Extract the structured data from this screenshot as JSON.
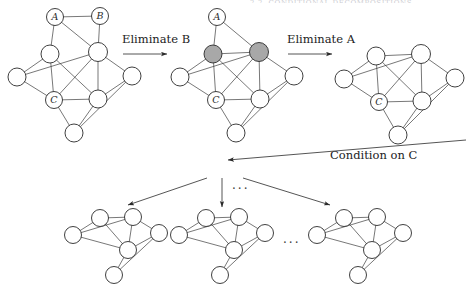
{
  "figure": {
    "title_strip": "2.2.  CONDITIONAL DECOMPOSITIONS",
    "kind": "graph-elimination-diagram",
    "ink_color": "#2a2a2a",
    "node_fill": "#ffffff",
    "eliminated_fill": "#a8a8a8",
    "labels": {
      "eliminate_b": "Eliminate B",
      "eliminate_a": "Eliminate A",
      "condition_on_c": "Condition on C",
      "vertical_ellipsis": "...",
      "horizontal_ellipsis": "..."
    },
    "node_labels": {
      "a": "A",
      "b": "B",
      "c": "C"
    }
  },
  "graphs": [
    {
      "id": "graph-original",
      "name": "original-graph",
      "caption": "",
      "nodes": [
        {
          "id": "A",
          "x": 55,
          "y": 17,
          "r": 8.5,
          "label": "A",
          "fill": "white"
        },
        {
          "id": "B",
          "x": 100,
          "y": 16,
          "r": 8.5,
          "label": "B",
          "fill": "white"
        },
        {
          "id": "n1",
          "x": 50,
          "y": 54,
          "r": 9,
          "label": "",
          "fill": "white"
        },
        {
          "id": "n2",
          "x": 98,
          "y": 52,
          "r": 9.5,
          "label": "",
          "fill": "white"
        },
        {
          "id": "n3",
          "x": 17,
          "y": 77,
          "r": 9,
          "label": "",
          "fill": "white"
        },
        {
          "id": "n4",
          "x": 132,
          "y": 76,
          "r": 9,
          "label": "",
          "fill": "white"
        },
        {
          "id": "C",
          "x": 54,
          "y": 100,
          "r": 8.5,
          "label": "C",
          "fill": "white"
        },
        {
          "id": "n5",
          "x": 98,
          "y": 99,
          "r": 9,
          "label": "",
          "fill": "white"
        },
        {
          "id": "n6",
          "x": 74,
          "y": 133,
          "r": 9,
          "label": "",
          "fill": "white"
        }
      ],
      "edges": [
        [
          "A",
          "B"
        ],
        [
          "A",
          "n1"
        ],
        [
          "A",
          "n2"
        ],
        [
          "B",
          "n2"
        ],
        [
          "n1",
          "n3"
        ],
        [
          "n1",
          "C"
        ],
        [
          "n1",
          "n5"
        ],
        [
          "n2",
          "n3"
        ],
        [
          "n2",
          "n4"
        ],
        [
          "n2",
          "C"
        ],
        [
          "n2",
          "n5"
        ],
        [
          "n3",
          "C"
        ],
        [
          "n4",
          "n5"
        ],
        [
          "n4",
          "n6"
        ],
        [
          "C",
          "n5"
        ],
        [
          "C",
          "n6"
        ],
        [
          "n5",
          "n6"
        ]
      ]
    },
    {
      "id": "graph-eliminated-b",
      "name": "graph-after-eliminating-b",
      "caption": "",
      "nodes": [
        {
          "id": "A",
          "x": 217,
          "y": 17,
          "r": 8.5,
          "label": "A",
          "fill": "white"
        },
        {
          "id": "n1",
          "x": 213,
          "y": 54,
          "r": 9,
          "label": "",
          "fill": "grey"
        },
        {
          "id": "n2",
          "x": 259,
          "y": 52,
          "r": 9.5,
          "label": "",
          "fill": "grey"
        },
        {
          "id": "n3",
          "x": 180,
          "y": 77,
          "r": 9,
          "label": "",
          "fill": "white"
        },
        {
          "id": "n4",
          "x": 294,
          "y": 76,
          "r": 9,
          "label": "",
          "fill": "white"
        },
        {
          "id": "C",
          "x": 216,
          "y": 100,
          "r": 8.5,
          "label": "C",
          "fill": "white"
        },
        {
          "id": "n5",
          "x": 260,
          "y": 99,
          "r": 9,
          "label": "",
          "fill": "white"
        },
        {
          "id": "n6",
          "x": 236,
          "y": 133,
          "r": 9,
          "label": "",
          "fill": "white"
        }
      ],
      "edges": [
        [
          "A",
          "n1"
        ],
        [
          "A",
          "n2"
        ],
        [
          "n1",
          "n2"
        ],
        [
          "n1",
          "n3"
        ],
        [
          "n1",
          "C"
        ],
        [
          "n1",
          "n5"
        ],
        [
          "n2",
          "n3"
        ],
        [
          "n2",
          "n4"
        ],
        [
          "n2",
          "C"
        ],
        [
          "n2",
          "n5"
        ],
        [
          "n3",
          "C"
        ],
        [
          "n4",
          "n5"
        ],
        [
          "n4",
          "n6"
        ],
        [
          "C",
          "n5"
        ],
        [
          "C",
          "n6"
        ],
        [
          "n5",
          "n6"
        ]
      ]
    },
    {
      "id": "graph-eliminated-a",
      "name": "graph-after-eliminating-a",
      "caption": "",
      "nodes": [
        {
          "id": "n1",
          "x": 376,
          "y": 56,
          "r": 9,
          "label": "",
          "fill": "white"
        },
        {
          "id": "n2",
          "x": 421,
          "y": 54,
          "r": 9.5,
          "label": "",
          "fill": "white"
        },
        {
          "id": "n3",
          "x": 344,
          "y": 79,
          "r": 9,
          "label": "",
          "fill": "white"
        },
        {
          "id": "n4",
          "x": 455,
          "y": 78,
          "r": 9,
          "label": "",
          "fill": "white"
        },
        {
          "id": "C",
          "x": 379,
          "y": 102,
          "r": 8.5,
          "label": "C",
          "fill": "white"
        },
        {
          "id": "n5",
          "x": 422,
          "y": 101,
          "r": 9,
          "label": "",
          "fill": "white"
        },
        {
          "id": "n6",
          "x": 398,
          "y": 135,
          "r": 9,
          "label": "",
          "fill": "white"
        }
      ],
      "edges": [
        [
          "n1",
          "n2"
        ],
        [
          "n1",
          "n3"
        ],
        [
          "n1",
          "C"
        ],
        [
          "n1",
          "n5"
        ],
        [
          "n2",
          "n3"
        ],
        [
          "n2",
          "n4"
        ],
        [
          "n2",
          "C"
        ],
        [
          "n2",
          "n5"
        ],
        [
          "n3",
          "C"
        ],
        [
          "n4",
          "n5"
        ],
        [
          "n4",
          "n6"
        ],
        [
          "C",
          "n5"
        ],
        [
          "C",
          "n6"
        ],
        [
          "n5",
          "n6"
        ]
      ]
    },
    {
      "id": "graph-cond-1",
      "name": "conditioned-graph-1",
      "caption": "",
      "nodes": [
        {
          "id": "m1",
          "x": 100,
          "y": 218,
          "r": 8.5,
          "label": "",
          "fill": "white"
        },
        {
          "id": "m2",
          "x": 133,
          "y": 217,
          "r": 8.5,
          "label": "",
          "fill": "white"
        },
        {
          "id": "m0",
          "x": 73,
          "y": 235,
          "r": 8.5,
          "label": "",
          "fill": "white"
        },
        {
          "id": "m3",
          "x": 159,
          "y": 233,
          "r": 8.5,
          "label": "",
          "fill": "white"
        },
        {
          "id": "m4",
          "x": 128,
          "y": 250,
          "r": 8.5,
          "label": "",
          "fill": "white"
        },
        {
          "id": "m5",
          "x": 114,
          "y": 275,
          "r": 8.5,
          "label": "",
          "fill": "white"
        }
      ],
      "edges": [
        [
          "m1",
          "m2"
        ],
        [
          "m1",
          "m0"
        ],
        [
          "m1",
          "m4"
        ],
        [
          "m2",
          "m0"
        ],
        [
          "m2",
          "m3"
        ],
        [
          "m2",
          "m4"
        ],
        [
          "m0",
          "m4"
        ],
        [
          "m3",
          "m4"
        ],
        [
          "m3",
          "m5"
        ],
        [
          "m4",
          "m5"
        ]
      ]
    },
    {
      "id": "graph-cond-2",
      "name": "conditioned-graph-2",
      "caption": "",
      "nodes": [
        {
          "id": "m1",
          "x": 206,
          "y": 218,
          "r": 8.5,
          "label": "",
          "fill": "white"
        },
        {
          "id": "m2",
          "x": 239,
          "y": 217,
          "r": 8.5,
          "label": "",
          "fill": "white"
        },
        {
          "id": "m0",
          "x": 179,
          "y": 235,
          "r": 8.5,
          "label": "",
          "fill": "white"
        },
        {
          "id": "m3",
          "x": 265,
          "y": 233,
          "r": 8.5,
          "label": "",
          "fill": "white"
        },
        {
          "id": "m4",
          "x": 234,
          "y": 250,
          "r": 8.5,
          "label": "",
          "fill": "white"
        },
        {
          "id": "m5",
          "x": 220,
          "y": 275,
          "r": 8.5,
          "label": "",
          "fill": "white"
        }
      ],
      "edges": [
        [
          "m1",
          "m2"
        ],
        [
          "m1",
          "m0"
        ],
        [
          "m1",
          "m4"
        ],
        [
          "m2",
          "m0"
        ],
        [
          "m2",
          "m3"
        ],
        [
          "m2",
          "m4"
        ],
        [
          "m0",
          "m4"
        ],
        [
          "m3",
          "m4"
        ],
        [
          "m3",
          "m5"
        ],
        [
          "m4",
          "m5"
        ]
      ]
    },
    {
      "id": "graph-cond-3",
      "name": "conditioned-graph-3",
      "caption": "",
      "nodes": [
        {
          "id": "m1",
          "x": 344,
          "y": 218,
          "r": 8.5,
          "label": "",
          "fill": "white"
        },
        {
          "id": "m2",
          "x": 377,
          "y": 217,
          "r": 8.5,
          "label": "",
          "fill": "white"
        },
        {
          "id": "m0",
          "x": 317,
          "y": 235,
          "r": 8.5,
          "label": "",
          "fill": "white"
        },
        {
          "id": "m3",
          "x": 403,
          "y": 233,
          "r": 8.5,
          "label": "",
          "fill": "white"
        },
        {
          "id": "m4",
          "x": 372,
          "y": 250,
          "r": 8.5,
          "label": "",
          "fill": "white"
        },
        {
          "id": "m5",
          "x": 358,
          "y": 275,
          "r": 8.5,
          "label": "",
          "fill": "white"
        }
      ],
      "edges": [
        [
          "m1",
          "m2"
        ],
        [
          "m1",
          "m0"
        ],
        [
          "m1",
          "m4"
        ],
        [
          "m2",
          "m0"
        ],
        [
          "m2",
          "m3"
        ],
        [
          "m2",
          "m4"
        ],
        [
          "m0",
          "m4"
        ],
        [
          "m3",
          "m4"
        ],
        [
          "m3",
          "m5"
        ],
        [
          "m4",
          "m5"
        ]
      ]
    }
  ],
  "arrows": [
    {
      "id": "arrow-eliminate-b",
      "x1": 123,
      "y1": 54,
      "x2": 167,
      "y2": 54,
      "label": "Eliminate B"
    },
    {
      "id": "arrow-eliminate-a",
      "x1": 288,
      "y1": 54,
      "x2": 332,
      "y2": 54,
      "label": "Eliminate A"
    },
    {
      "id": "arrow-condition-on-c",
      "x1": 466,
      "y1": 140,
      "x2": 228,
      "y2": 160,
      "label": "Condition on C"
    },
    {
      "id": "arrow-branch-left",
      "x1": 207,
      "y1": 178,
      "x2": 128,
      "y2": 205,
      "label": ""
    },
    {
      "id": "arrow-branch-middle",
      "x1": 222,
      "y1": 178,
      "x2": 222,
      "y2": 207,
      "label": ""
    },
    {
      "id": "arrow-branch-right",
      "x1": 243,
      "y1": 178,
      "x2": 330,
      "y2": 205,
      "label": ""
    }
  ]
}
